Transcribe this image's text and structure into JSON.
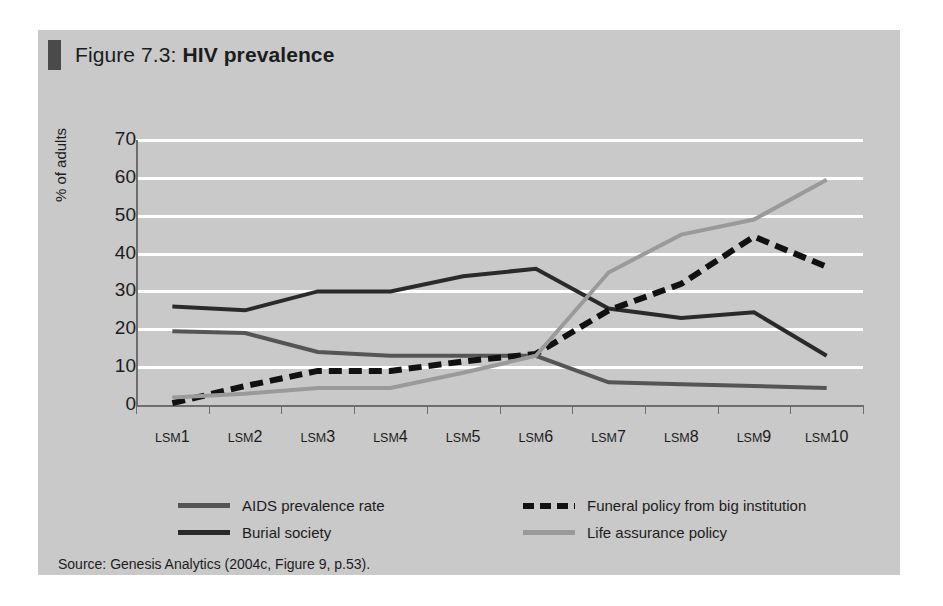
{
  "figure": {
    "number_label": "Figure 7.3:",
    "title": "HIV prevalence",
    "source": "Source: Genesis Analytics (2004c, Figure 9, p.53)."
  },
  "colors": {
    "panel_background": "#c9c9c9",
    "gridline": "#ffffff",
    "axis": "#6e6e6e",
    "aids_prevalence_rate": "#555555",
    "burial_society": "#2a2a2a",
    "funeral_policy": "#111111",
    "life_assurance_policy": "#9a9a9a",
    "title_marker": "#4a4a4a",
    "text": "#1c1c1c"
  },
  "legend": {
    "position": "below-plot",
    "entries": [
      {
        "label": "AIDS prevalence rate",
        "style": "solid",
        "color": "#555555"
      },
      {
        "label": "Funeral policy from big institution",
        "style": "dashed",
        "color": "#111111"
      },
      {
        "label": "Burial society",
        "style": "solid",
        "color": "#2a2a2a"
      },
      {
        "label": "Life assurance policy",
        "style": "solid",
        "color": "#9a9a9a"
      }
    ]
  },
  "chart_data": {
    "type": "line",
    "title": "HIV prevalence",
    "xlabel": "",
    "ylabel": "% of adults",
    "ylim": [
      0,
      70
    ],
    "yticks": [
      0,
      10,
      20,
      30,
      40,
      50,
      60,
      70
    ],
    "grid": true,
    "legend_position": "bottom",
    "categories": [
      "LSM1",
      "LSM2",
      "LSM3",
      "LSM4",
      "LSM5",
      "LSM6",
      "LSM7",
      "LSM8",
      "LSM9",
      "LSM10"
    ],
    "series": [
      {
        "name": "AIDS prevalence rate",
        "style": "solid",
        "color": "#555555",
        "values": [
          19.5,
          19,
          14,
          13,
          13,
          13,
          6,
          5.5,
          5,
          4.5
        ]
      },
      {
        "name": "Burial society",
        "style": "solid",
        "color": "#2a2a2a",
        "values": [
          26,
          25,
          30,
          30,
          34,
          36,
          25.5,
          23,
          24.5,
          13
        ]
      },
      {
        "name": "Funeral policy from big institution",
        "style": "dashed",
        "color": "#111111",
        "values": [
          0.5,
          5,
          9,
          9,
          11.5,
          13.5,
          25,
          32,
          44.5,
          36.5
        ]
      },
      {
        "name": "Life assurance policy",
        "style": "solid",
        "color": "#9a9a9a",
        "values": [
          2,
          3,
          4.5,
          4.5,
          8.5,
          13,
          35,
          45,
          49,
          59.5
        ]
      }
    ]
  }
}
